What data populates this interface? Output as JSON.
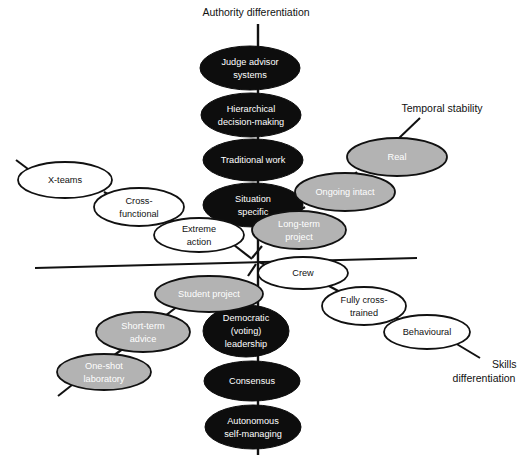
{
  "figure": {
    "background_color": "#ffffff",
    "line_color": "#111111",
    "fill_dark": "#0d0d0d",
    "fill_gray": "#b3b3b3",
    "fill_white": "#ffffff",
    "text_on_dark": "#ffffff",
    "text_on_gray": "#ffffff",
    "text_on_white": "#111111"
  },
  "axes": [
    {
      "id": "authority",
      "label": "Authority differentiation"
    },
    {
      "id": "temporal",
      "label": "Temporal stability"
    },
    {
      "id": "skills",
      "label": "Skills differentiation"
    }
  ],
  "nodes": [
    {
      "id": "judge-advisor",
      "label_lines": [
        "Judge advisor",
        "systems"
      ],
      "style": "dark"
    },
    {
      "id": "hierarchical",
      "label_lines": [
        "Hierarchical",
        "decision-making"
      ],
      "style": "dark"
    },
    {
      "id": "traditional-work",
      "label_lines": [
        "Traditional work"
      ],
      "style": "dark"
    },
    {
      "id": "situation-specific",
      "label_lines": [
        "Situation",
        "specific"
      ],
      "style": "dark"
    },
    {
      "id": "democratic",
      "label_lines": [
        "Democratic",
        "(voting)",
        "leadership"
      ],
      "style": "dark"
    },
    {
      "id": "consensus",
      "label_lines": [
        "Consensus"
      ],
      "style": "dark"
    },
    {
      "id": "autonomous",
      "label_lines": [
        "Autonomous",
        "self-managing"
      ],
      "style": "dark"
    },
    {
      "id": "real",
      "label_lines": [
        "Real"
      ],
      "style": "gray"
    },
    {
      "id": "ongoing-intact",
      "label_lines": [
        "Ongoing intact"
      ],
      "style": "gray"
    },
    {
      "id": "long-term-project",
      "label_lines": [
        "Long-term",
        "project"
      ],
      "style": "gray"
    },
    {
      "id": "student-project",
      "label_lines": [
        "Student project"
      ],
      "style": "gray"
    },
    {
      "id": "short-term-advice",
      "label_lines": [
        "Short-term",
        "advice"
      ],
      "style": "gray"
    },
    {
      "id": "one-shot-laboratory",
      "label_lines": [
        "One-shot",
        "laboratory"
      ],
      "style": "gray"
    },
    {
      "id": "x-teams",
      "label_lines": [
        "X-teams"
      ],
      "style": "white"
    },
    {
      "id": "cross-functional",
      "label_lines": [
        "Cross-",
        "functional"
      ],
      "style": "white"
    },
    {
      "id": "extreme-action",
      "label_lines": [
        "Extreme",
        "action"
      ],
      "style": "white"
    },
    {
      "id": "crew",
      "label_lines": [
        "Crew"
      ],
      "style": "white"
    },
    {
      "id": "fully-cross-trained",
      "label_lines": [
        "Fully cross-",
        "trained"
      ],
      "style": "white"
    },
    {
      "id": "behavioural",
      "label_lines": [
        "Behavioural"
      ],
      "style": "white"
    }
  ]
}
